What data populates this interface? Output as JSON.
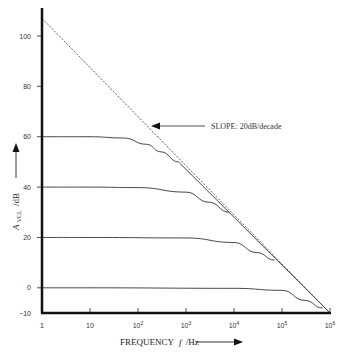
{
  "chart_data": {
    "type": "line",
    "title": "",
    "xlabel": "FREQUENCY f /Hz",
    "ylabel": "A_VCL /dB",
    "xscale": "log",
    "xlim": [
      1,
      1000000
    ],
    "ylim": [
      -10,
      110
    ],
    "grid": false,
    "legend": null,
    "x_ticks": [
      {
        "value": 1,
        "label": "1"
      },
      {
        "value": 10,
        "label": "10"
      },
      {
        "value": 100,
        "label": "10",
        "sup": "2"
      },
      {
        "value": 1000,
        "label": "10",
        "sup": "3"
      },
      {
        "value": 10000,
        "label": "10",
        "sup": "4"
      },
      {
        "value": 100000,
        "label": "10",
        "sup": "5"
      },
      {
        "value": 1000000,
        "label": "10",
        "sup": "6"
      }
    ],
    "y_ticks": [
      {
        "value": 100,
        "label": "100"
      },
      {
        "value": 80,
        "label": "80"
      },
      {
        "value": 60,
        "label": "60"
      },
      {
        "value": 40,
        "label": "40"
      },
      {
        "value": 20,
        "label": "20"
      },
      {
        "value": 0,
        "label": "0"
      },
      {
        "value": -10,
        "label": "−10"
      }
    ],
    "series": [
      {
        "name": "Open-loop asymptote",
        "style": "dashed",
        "x": [
          1,
          10,
          100,
          1000,
          10000,
          100000,
          1000000
        ],
        "values": [
          110,
          90,
          70,
          50,
          30,
          10,
          -10
        ]
      },
      {
        "name": "Closed-loop 60 dB",
        "style": "solid",
        "x": [
          1,
          10,
          50,
          150,
          300,
          700
        ],
        "values": [
          60,
          60,
          59.5,
          57,
          54,
          50
        ]
      },
      {
        "name": "Closed-loop 40 dB",
        "style": "solid",
        "x": [
          1,
          10,
          100,
          1000,
          3000,
          8000
        ],
        "values": [
          40,
          40,
          39.8,
          38,
          34,
          30
        ]
      },
      {
        "name": "Closed-loop 20 dB",
        "style": "solid",
        "x": [
          1,
          10,
          1000,
          10000,
          30000,
          70000
        ],
        "values": [
          20,
          20,
          19.8,
          18,
          14,
          11
        ]
      },
      {
        "name": "Closed-loop 0 dB",
        "style": "solid",
        "x": [
          1,
          10,
          10000,
          100000,
          300000,
          700000
        ],
        "values": [
          0,
          0,
          -0.2,
          -1,
          -5,
          -8
        ]
      }
    ],
    "annotations": [
      {
        "text": "SLOPE: 20dB/decade",
        "arrow_to": {
          "x": 150,
          "y": 67
        }
      }
    ]
  },
  "labels": {
    "slope": "SLOPE: 20dB/decade",
    "xaxis": "FREQUENCY",
    "xaxis_var": "f",
    "xaxis_unit": "/Hz",
    "yaxis_A": "A",
    "yaxis_sub": "VCL",
    "yaxis_unit": "/dB"
  }
}
